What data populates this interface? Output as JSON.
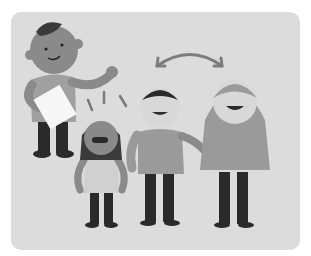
{
  "illustration": {
    "description": "Grayscale illustration of an adult holding a paper and waving, with three children; a curved double-headed arrow above two children",
    "figures": [
      "adult-with-paper",
      "girl-excited",
      "boy-middle",
      "girl-long-hair"
    ],
    "colors": {
      "background": "#dcdcdc",
      "skin_dark": "#8a8a8a",
      "skin_light": "#d8d8d8",
      "shirt": "#9a9a9a",
      "pants": "#2a2a2a",
      "hair": "#3a3a3a",
      "paper": "#f7f7f7"
    }
  }
}
